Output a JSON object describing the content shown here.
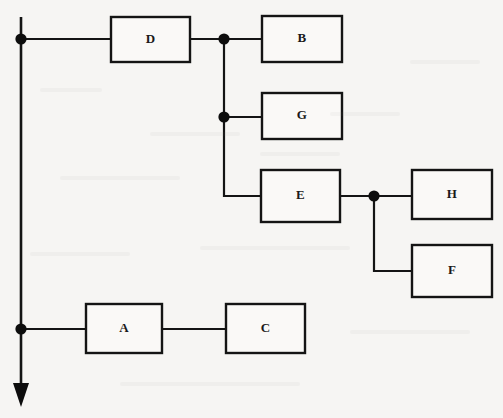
{
  "diagram": {
    "type": "block-flowchart",
    "canvas": {
      "width": 503,
      "height": 418
    },
    "background_color": "#f6f5f3",
    "line_color": "#141414",
    "node_fill": "#faf9f7",
    "nodes": [
      {
        "id": "D",
        "label": "D",
        "x": 111,
        "y": 17,
        "w": 79,
        "h": 45
      },
      {
        "id": "B",
        "label": "B",
        "x": 262,
        "y": 16,
        "w": 80,
        "h": 46
      },
      {
        "id": "G",
        "label": "G",
        "x": 262,
        "y": 93,
        "w": 80,
        "h": 46
      },
      {
        "id": "E",
        "label": "E",
        "x": 261,
        "y": 170,
        "w": 79,
        "h": 52
      },
      {
        "id": "H",
        "label": "H",
        "x": 412,
        "y": 170,
        "w": 80,
        "h": 49
      },
      {
        "id": "F",
        "label": "F",
        "x": 412,
        "y": 245,
        "w": 80,
        "h": 52
      },
      {
        "id": "A",
        "label": "A",
        "x": 86,
        "y": 304,
        "w": 76,
        "h": 49
      },
      {
        "id": "C",
        "label": "C",
        "x": 226,
        "y": 304,
        "w": 79,
        "h": 49
      }
    ],
    "junctions": [
      {
        "id": "j-trunk-top",
        "x": 21,
        "y": 39,
        "r": 5.6
      },
      {
        "id": "j-d-out",
        "x": 224,
        "y": 39,
        "r": 5.6
      },
      {
        "id": "j-g-in",
        "x": 224,
        "y": 117,
        "r": 5.6
      },
      {
        "id": "j-e-out",
        "x": 374,
        "y": 196,
        "r": 5.6
      },
      {
        "id": "j-trunk-bottom",
        "x": 21,
        "y": 329,
        "r": 5.6
      }
    ],
    "edges": [
      {
        "id": "trunk-main",
        "from": "trunk-top",
        "to": "arrow",
        "path": "M 21 17 L 21 390"
      },
      {
        "id": "trunk-to-d",
        "from": "j-trunk-top",
        "to": "D",
        "path": "M 21 39 L 111 39"
      },
      {
        "id": "d-to-junction",
        "from": "D",
        "to": "j-d-out",
        "path": "M 190 39 L 224 39"
      },
      {
        "id": "junction-to-b",
        "from": "j-d-out",
        "to": "B",
        "path": "M 224 39 L 262 39"
      },
      {
        "id": "branch-vertical",
        "from": "j-d-out",
        "to": "j-g-in",
        "path": "M 224 39 L 224 117"
      },
      {
        "id": "junction-to-g",
        "from": "j-g-in",
        "to": "G",
        "path": "M 224 117 L 262 117"
      },
      {
        "id": "g-down-to-e",
        "from": "j-g-in",
        "to": "E",
        "path": "M 224 117 L 224 196 L 261 196"
      },
      {
        "id": "e-to-junction",
        "from": "E",
        "to": "j-e-out",
        "path": "M 340 196 L 374 196"
      },
      {
        "id": "junction-to-h",
        "from": "j-e-out",
        "to": "H",
        "path": "M 374 196 L 412 196"
      },
      {
        "id": "junction-to-f",
        "from": "j-e-out",
        "to": "F",
        "path": "M 374 196 L 374 271 L 412 271"
      },
      {
        "id": "trunk-to-a",
        "from": "j-trunk-bottom",
        "to": "A",
        "path": "M 21 329 L 86 329"
      },
      {
        "id": "a-to-c",
        "from": "A",
        "to": "C",
        "path": "M 162 329 L 226 329"
      }
    ],
    "arrow": {
      "id": "flow-arrow-down",
      "tip_x": 21,
      "tip_y": 407,
      "points": "13,383 29,383 21,407"
    }
  }
}
